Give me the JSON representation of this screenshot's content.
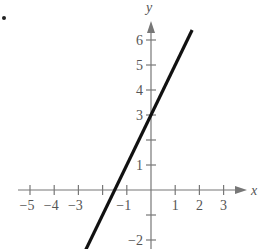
{
  "bullet": "•",
  "chart_data": {
    "type": "line",
    "title": "",
    "xlabel": "x",
    "ylabel": "y",
    "xlim": [
      -5.5,
      3.8
    ],
    "ylim": [
      -2.4,
      7
    ],
    "x_ticks": [
      -5,
      -4,
      -3,
      -2,
      -1,
      1,
      2,
      3
    ],
    "x_tick_labels": [
      "−5",
      "−4",
      "−3",
      "",
      "−1",
      "1",
      "2",
      "3"
    ],
    "y_ticks": [
      -2,
      -1,
      1,
      2,
      3,
      4,
      5,
      6
    ],
    "y_tick_labels": [
      "−2",
      "",
      "1",
      "",
      "3",
      "4",
      "5",
      "6"
    ],
    "grid": false,
    "series": [
      {
        "name": "y = 2x + 3",
        "x": [
          -2.7,
          1.7
        ],
        "y": [
          -2.4,
          6.4
        ],
        "equation": "y = 2x + 3"
      }
    ],
    "colors": {
      "axis": "#777777",
      "line": "#111111",
      "text": "#555555"
    }
  }
}
